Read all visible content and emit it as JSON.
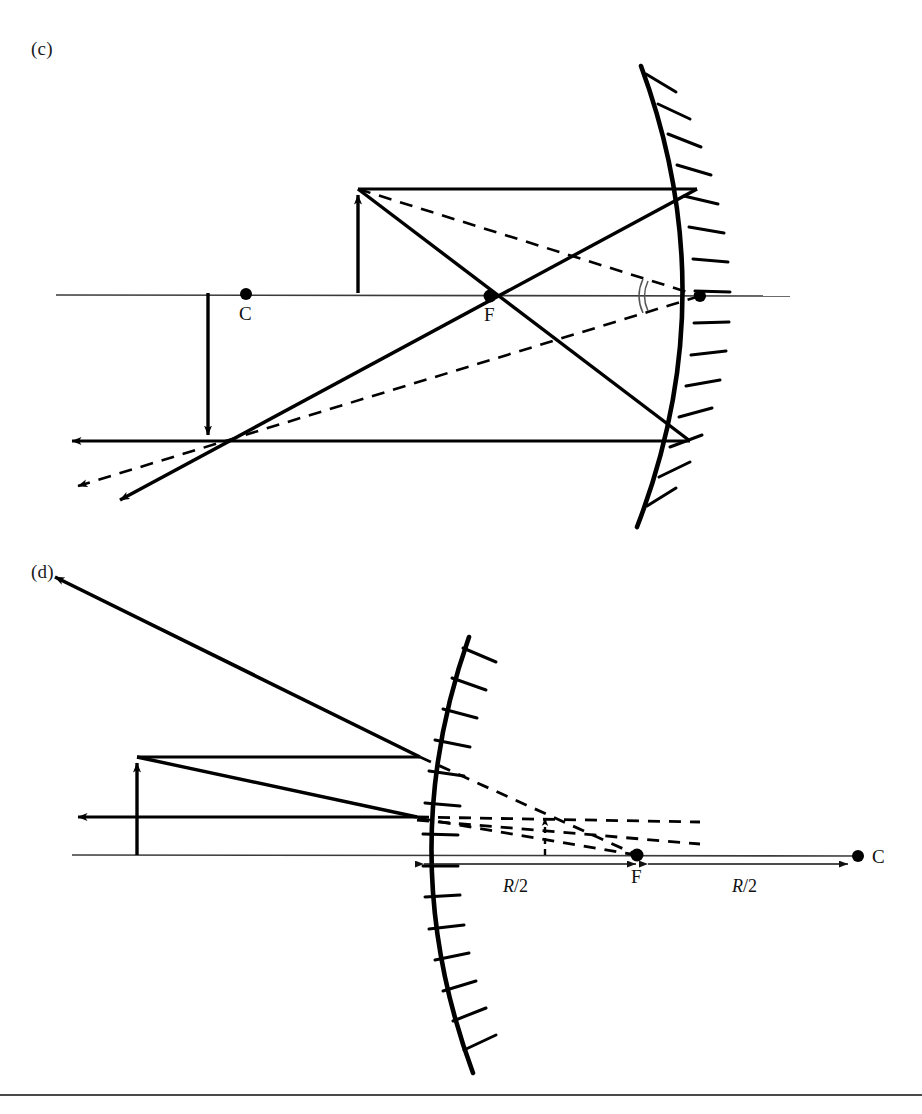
{
  "figure": {
    "background_color": "#ffffff",
    "ink_color": "#000000",
    "axis_color": "#333333",
    "panels": [
      {
        "id": "c",
        "label": "(c)",
        "mirror_type": "concave",
        "description": "Concave mirror with object between C and F; real inverted magnified image formed outside C",
        "points": [
          {
            "name": "C",
            "label": "C",
            "x": 246,
            "y": 295,
            "dot": true
          },
          {
            "name": "F",
            "label": "F",
            "x": 490,
            "y": 298,
            "dot": true
          },
          {
            "name": "V",
            "label": "",
            "x": 700,
            "y": 298,
            "dot": true
          }
        ],
        "object": {
          "base_x": 358,
          "base_y": 293,
          "tip_y": 189,
          "direction": "up"
        },
        "image": {
          "base_x": 208,
          "base_y": 293,
          "tip_y": 441,
          "direction": "down"
        },
        "angle_marks": 2
      },
      {
        "id": "d",
        "label": "(d)",
        "mirror_type": "convex",
        "description": "Convex mirror with object in front; virtual upright diminished image behind mirror between vertex and F",
        "points": [
          {
            "name": "F",
            "label": "F",
            "x": 637,
            "y": 855,
            "dot": true
          },
          {
            "name": "C",
            "label": "C",
            "x": 858,
            "y": 856,
            "dot": true
          }
        ],
        "object": {
          "base_x": 137,
          "base_y": 855,
          "tip_y": 757,
          "direction": "up"
        },
        "image": {
          "base_x": 545,
          "base_y": 855,
          "tip_y": 813,
          "direction": "up",
          "virtual": true
        },
        "dimensions": [
          {
            "label": "R/2",
            "symbol_italic": "R",
            "symbol_rest": "/2",
            "from": "vertex",
            "to": "F",
            "x": 290,
            "y": 884
          },
          {
            "label": "R/2",
            "symbol_italic": "R",
            "symbol_rest": "/2",
            "from": "F",
            "to": "C",
            "x": 500,
            "y": 884
          }
        ]
      }
    ]
  }
}
